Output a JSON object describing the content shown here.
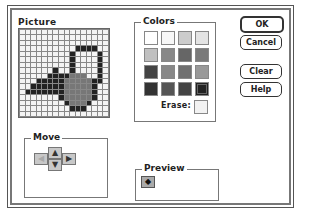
{
  "picture": {
    "label": "Picture",
    "palette": {
      "W": "#f4f4f4",
      "B": "#222222",
      "G": "#777777"
    },
    "rows": [
      "WWWWWWWWWWWWWWWW",
      "WWWWWWWWWWWWWWWW",
      "WWWWWWWWWWWWWWWW",
      "WWWWWWWWWWBBBBWW",
      "WWWWWWWWWBWWWWBW",
      "WWWWWWWWWBWWWWBW",
      "WWWWWWWWWBWWWWBW",
      "WWWWWWBWWBWWWWBW",
      "WWWWWBBBBGGGWWBW",
      "WWWBBBBBGGGGGBBW",
      "WWBBBBBBGGGGGBWW",
      "WBBBBBBBGGGGGBWW",
      "WWWWWWWBGGGGGBWW",
      "WWWWWWWWBGGGBWWW",
      "WWWWWWWWWBBBWWWW",
      "WWWWWWWWWWWWWWWW"
    ]
  },
  "colors": {
    "label": "Colors",
    "swatches": [
      "#ffffff",
      "#f8f8f8",
      "#cccccc",
      "#e4e4e4",
      "#c0c0c0",
      "#888888",
      "#666666",
      "#7a7a7a",
      "#444444",
      "#888888",
      "#707070",
      "#999999",
      "#333333",
      "#555555",
      "#444444",
      "#222222"
    ],
    "selected_index": 15,
    "erase_label": "Erase:",
    "erase_color": "#f2f2f2"
  },
  "buttons": {
    "ok": "OK",
    "cancel": "Cancel",
    "clear": "Clear",
    "help": "Help"
  },
  "move": {
    "label": "Move",
    "up": "▲",
    "down": "▼",
    "left": "◀",
    "right": "▶"
  },
  "preview": {
    "label": "Preview",
    "icon": "◆"
  }
}
